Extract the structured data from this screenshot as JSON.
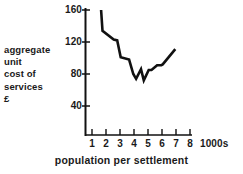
{
  "chart_data": {
    "type": "line",
    "title": "",
    "subtitle": "",
    "xlabel": "population per settlement",
    "ylabel": "aggregate unit cost of services £",
    "ylabel_lines": [
      "aggregate",
      "unit",
      "cost of",
      "services",
      "£"
    ],
    "x_unit_label": "1000s",
    "xlim": [
      0,
      8.5
    ],
    "ylim": [
      0,
      168
    ],
    "yticks": [
      40,
      80,
      120,
      160
    ],
    "ytick_labels": [
      "40",
      "80",
      "120",
      "160"
    ],
    "xticks": [
      1,
      2,
      3,
      4,
      5,
      6,
      7,
      8
    ],
    "xtick_labels": [
      "1",
      "2",
      "3",
      "4",
      "5",
      "6",
      "7",
      "8"
    ],
    "grid": false,
    "legend": null,
    "series": [
      {
        "name": "aggregate unit cost of services",
        "color": "#111111",
        "x": [
          1.65,
          1.75,
          2.55,
          2.8,
          3.05,
          3.65,
          3.95,
          4.15,
          4.5,
          4.7,
          5.05,
          5.25,
          5.65,
          5.95,
          6.05,
          6.95
        ],
        "y": [
          160,
          134,
          123,
          122,
          101,
          98,
          80,
          74,
          86,
          72,
          85,
          85,
          91,
          91,
          92,
          111
        ]
      }
    ],
    "annotations": []
  },
  "axes": {
    "y_axis_label_text": "aggregate unit cost of services £",
    "x_axis_label_text": "population per settlement",
    "x_unit": "1000s"
  }
}
